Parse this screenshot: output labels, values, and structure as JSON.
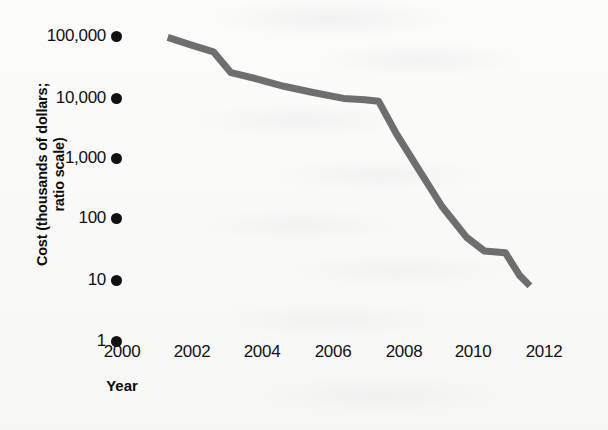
{
  "axes": {
    "y_title_line1": "Cost (thousands of dollars;",
    "y_title_line2": "ratio scale)",
    "x_title": "Year"
  },
  "colors": {
    "line": "#6e6e6e",
    "ink": "#111111",
    "paper": "#fbfbfa"
  },
  "chart_data": {
    "type": "line",
    "title": "",
    "xlabel": "Year",
    "ylabel": "Cost (thousands of dollars; ratio scale)",
    "scale": "log",
    "grid": false,
    "legend": "none",
    "xlim": [
      2000,
      2012
    ],
    "ylim": [
      1,
      100000
    ],
    "x_tick_labels": [
      "2000",
      "2002",
      "2004",
      "2006",
      "2008",
      "2010",
      "2012"
    ],
    "x_ticks": [
      2000,
      2002,
      2004,
      2006,
      2008,
      2010,
      2012
    ],
    "y_tick_labels": [
      "100,000",
      "10,000",
      "1,000",
      "100",
      "10",
      "1"
    ],
    "y_ticks": [
      100000,
      10000,
      1000,
      100,
      10,
      1
    ],
    "series": [
      {
        "name": "Cost",
        "x": [
          2001.3,
          2002.0,
          2002.6,
          2003.1,
          2003.8,
          2004.6,
          2005.4,
          2006.3,
          2006.9,
          2007.3,
          2007.8,
          2008.4,
          2009.1,
          2009.8,
          2010.3,
          2010.9,
          2011.3,
          2011.6
        ],
        "values": [
          95000,
          70000,
          55000,
          25000,
          20000,
          15000,
          12000,
          9500,
          9000,
          8500,
          2500,
          700,
          160,
          50,
          30,
          28,
          12,
          8
        ]
      }
    ]
  }
}
